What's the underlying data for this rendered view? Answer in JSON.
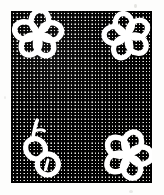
{
  "image": {
    "title": "Embroidered floral motifs on gingham mesh fabric",
    "kind": "scanned-textile-photograph",
    "width": 164,
    "height": 195,
    "background_color": "#fdfdfc"
  },
  "swatch": {
    "label": "gingham-mesh-fabric-swatch",
    "x": 11,
    "y": 11,
    "width": 141,
    "height": 172,
    "weave": {
      "description": "fine square grid / checked mesh",
      "cell_size_px": 3.4,
      "thread_color": "#111111",
      "gap_color": "#f2f2f0",
      "midtone_color": "#8d8d8d"
    }
  },
  "motifs": [
    {
      "name": "flower-top-left",
      "type": "five-petal-flower",
      "petal_count": 5,
      "center_x": 38,
      "center_y": 34,
      "radius": 24,
      "stitch_color": "#ffffff",
      "fill": "fabric-showing-through"
    },
    {
      "name": "flower-top-right",
      "type": "five-petal-flower",
      "petal_count": 5,
      "center_x": 127,
      "center_y": 36,
      "radius": 23,
      "stitch_color": "#ffffff",
      "fill": "fabric-showing-through"
    },
    {
      "name": "flower-bottom-right",
      "type": "five-petal-flower",
      "petal_count": 5,
      "center_x": 128,
      "center_y": 155,
      "radius": 24,
      "stitch_color": "#ffffff",
      "fill": "fabric-showing-through"
    },
    {
      "name": "bud-bottom-left",
      "type": "bud-with-stem",
      "lobe_count": 2,
      "center_x": 42,
      "center_y": 157,
      "radius": 22,
      "stitch_color": "#ffffff",
      "fill": "fabric-showing-through",
      "stem_direction": "upper-right"
    }
  ],
  "artifacts": {
    "specks": [
      {
        "name": "speck-top",
        "x": 134,
        "y": 4
      },
      {
        "name": "speck-bottom",
        "x": 129,
        "y": 190
      },
      {
        "name": "speck-left",
        "x": 4,
        "y": 96
      }
    ]
  }
}
